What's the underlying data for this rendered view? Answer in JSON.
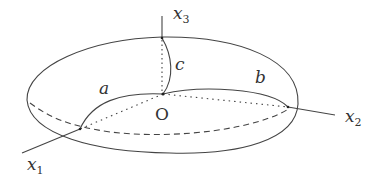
{
  "diagram": {
    "type": "ellipsoid-axes",
    "stroke_color": "#444444",
    "labels": {
      "x1": {
        "base": "x",
        "sub": "1"
      },
      "x2": {
        "base": "x",
        "sub": "2"
      },
      "x3": {
        "base": "x",
        "sub": "3"
      },
      "a": "a",
      "b": "b",
      "c": "c",
      "origin": "O"
    }
  }
}
